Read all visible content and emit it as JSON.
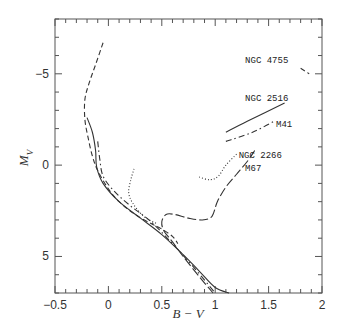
{
  "chart_data": {
    "type": "line",
    "title": "",
    "xlabel": "B − V",
    "ylabel": "M_V",
    "xlim": [
      -0.5,
      2
    ],
    "ylim": [
      7,
      -8
    ],
    "y_inverted": true,
    "grid": false,
    "legend": "inline labels",
    "x_ticks": [
      -0.5,
      0,
      0.5,
      1,
      1.5,
      2
    ],
    "x_tick_labels": [
      "−0.5",
      "0",
      "0.5",
      "1",
      "1.5",
      "2"
    ],
    "y_ticks": [
      -5,
      0,
      5
    ],
    "y_tick_labels": [
      "−5",
      "0",
      "5"
    ],
    "series": [
      {
        "name": "NGC 4755",
        "style": "dashed",
        "segments": [
          [
            [
              -0.05,
              -6.7
            ],
            [
              -0.12,
              -5.5
            ],
            [
              -0.18,
              -4.5
            ],
            [
              -0.22,
              -3.6
            ],
            [
              -0.22,
              -2.5
            ],
            [
              -0.19,
              -1.5
            ],
            [
              -0.15,
              -0.5
            ],
            [
              -0.1,
              0.3
            ],
            [
              0.0,
              1.3
            ],
            [
              0.1,
              2.0
            ],
            [
              0.25,
              2.7
            ],
            [
              0.4,
              3.2
            ],
            [
              0.5,
              3.5
            ],
            [
              0.6,
              3.9
            ],
            [
              0.65,
              4.3
            ]
          ],
          [
            [
              1.8,
              -5.3
            ],
            [
              1.88,
              -5.0
            ]
          ]
        ],
        "label_pos": [
          1.28,
          -5.6
        ]
      },
      {
        "name": "NGC 2516",
        "style": "solid",
        "segments": [
          [
            [
              -0.2,
              -2.6
            ],
            [
              -0.15,
              -1.8
            ],
            [
              -0.12,
              -0.8
            ],
            [
              -0.11,
              0.1
            ],
            [
              -0.05,
              1.0
            ],
            [
              0.1,
              2.0
            ],
            [
              0.3,
              2.9
            ],
            [
              0.5,
              3.8
            ],
            [
              0.7,
              4.9
            ],
            [
              0.85,
              5.8
            ],
            [
              1.0,
              6.7
            ],
            [
              1.13,
              7.0
            ]
          ],
          [
            [
              1.1,
              -1.8
            ],
            [
              1.3,
              -2.4
            ],
            [
              1.65,
              -3.4
            ]
          ]
        ],
        "label_pos": [
          1.28,
          -3.5
        ]
      },
      {
        "name": "M41",
        "style": "dashdot",
        "segments": [
          [
            [
              -0.1,
              -1.3
            ],
            [
              -0.08,
              -0.3
            ],
            [
              -0.05,
              0.6
            ],
            [
              0.05,
              1.4
            ],
            [
              0.2,
              2.2
            ],
            [
              0.4,
              3.1
            ],
            [
              0.6,
              4.3
            ],
            [
              0.8,
              5.6
            ],
            [
              1.0,
              7.0
            ]
          ],
          [
            [
              1.1,
              -1.3
            ],
            [
              1.35,
              -1.8
            ],
            [
              1.55,
              -2.4
            ]
          ]
        ],
        "label_pos": [
          1.57,
          -2.1
        ]
      },
      {
        "name": "NGC 2266",
        "style": "dotted",
        "segments": [
          [
            [
              0.24,
              0.2
            ],
            [
              0.21,
              0.8
            ],
            [
              0.19,
              1.5
            ],
            [
              0.23,
              2.1
            ],
            [
              0.33,
              2.8
            ],
            [
              0.45,
              3.2
            ]
          ],
          [
            [
              0.85,
              0.65
            ],
            [
              0.95,
              0.8
            ],
            [
              1.03,
              0.6
            ],
            [
              1.1,
              0.0
            ],
            [
              1.2,
              -0.6
            ]
          ]
        ],
        "label_pos": [
          1.22,
          -0.4
        ]
      },
      {
        "name": "M67",
        "style": "longdash",
        "segments": [
          [
            [
              1.37,
              -0.8
            ],
            [
              1.3,
              -0.2
            ],
            [
              1.2,
              0.5
            ],
            [
              1.1,
              1.2
            ],
            [
              1.02,
              2.0
            ],
            [
              0.97,
              2.8
            ],
            [
              0.88,
              3.0
            ],
            [
              0.75,
              2.9
            ],
            [
              0.62,
              2.7
            ],
            [
              0.54,
              2.7
            ],
            [
              0.5,
              3.1
            ],
            [
              0.52,
              3.6
            ],
            [
              0.6,
              4.2
            ],
            [
              0.7,
              5.0
            ],
            [
              0.85,
              6.1
            ],
            [
              0.98,
              7.0
            ]
          ]
        ],
        "label_pos": [
          1.28,
          0.3
        ]
      }
    ]
  }
}
